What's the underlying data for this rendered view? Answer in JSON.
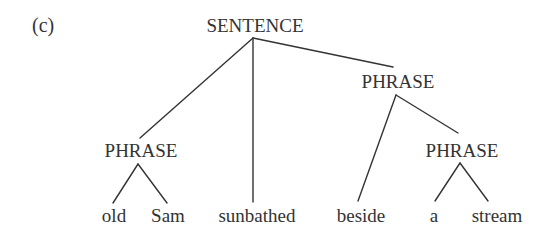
{
  "panel_label": "(c)",
  "colors": {
    "ink": "#333333",
    "background": "#ffffff"
  },
  "nodes": {
    "root": {
      "label": "SENTENCE",
      "type": "category",
      "x": 255,
      "y": 32
    },
    "np_left": {
      "label": "PHRASE",
      "type": "category",
      "x": 141,
      "y": 157
    },
    "pp": {
      "label": "PHRASE",
      "type": "category",
      "x": 398,
      "y": 88
    },
    "np_right": {
      "label": "PHRASE",
      "type": "category",
      "x": 462,
      "y": 157
    }
  },
  "words": [
    {
      "label": "old",
      "x": 114,
      "y": 222
    },
    {
      "label": "Sam",
      "x": 168,
      "y": 222
    },
    {
      "label": "sunbathed",
      "x": 257,
      "y": 222
    },
    {
      "label": "beside",
      "x": 361,
      "y": 222
    },
    {
      "label": "a",
      "x": 434,
      "y": 222
    },
    {
      "label": "stream",
      "x": 497,
      "y": 222
    }
  ],
  "edges": [
    {
      "from": "SENTENCE",
      "to": "PHRASE (left)",
      "x1": 253,
      "y1": 38,
      "x2": 140,
      "y2": 138
    },
    {
      "from": "SENTENCE",
      "to": "sunbathed",
      "x1": 253,
      "y1": 38,
      "x2": 253,
      "y2": 202
    },
    {
      "from": "SENTENCE",
      "to": "PHRASE (middle)",
      "x1": 253,
      "y1": 38,
      "x2": 393,
      "y2": 67
    },
    {
      "from": "PHRASE (left)",
      "to": "old",
      "x1": 138,
      "y1": 164,
      "x2": 113,
      "y2": 203
    },
    {
      "from": "PHRASE (left)",
      "to": "Sam",
      "x1": 138,
      "y1": 164,
      "x2": 167,
      "y2": 203
    },
    {
      "from": "PHRASE (middle)",
      "to": "beside",
      "x1": 396,
      "y1": 95,
      "x2": 358,
      "y2": 201
    },
    {
      "from": "PHRASE (middle)",
      "to": "PHRASE (right)",
      "x1": 396,
      "y1": 95,
      "x2": 458,
      "y2": 133
    },
    {
      "from": "PHRASE (right)",
      "to": "a",
      "x1": 460,
      "y1": 163,
      "x2": 435,
      "y2": 201
    },
    {
      "from": "PHRASE (right)",
      "to": "stream",
      "x1": 460,
      "y1": 163,
      "x2": 488,
      "y2": 201
    }
  ]
}
